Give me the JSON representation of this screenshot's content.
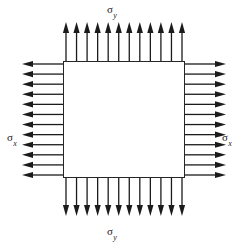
{
  "figure": {
    "type": "diagram",
    "width": 245,
    "height": 246,
    "background_color": "#ffffff",
    "stroke_color": "#1b1b1b"
  },
  "element": {
    "name": "square-element",
    "shape": "square",
    "x": 63,
    "y": 61,
    "width": 122,
    "height": 117,
    "fill": "#ffffff",
    "stroke": "#262626",
    "stroke_width": 1
  },
  "labels": {
    "sigma_y_top": {
      "symbol": "σ",
      "subscript": "y",
      "text": "σy"
    },
    "sigma_y_bottom": {
      "symbol": "σ",
      "subscript": "y",
      "text": "σy"
    },
    "sigma_x_left": {
      "symbol": "σ",
      "subscript": "x",
      "text": "σx"
    },
    "sigma_x_right": {
      "symbol": "σ",
      "subscript": "x",
      "text": "σx"
    }
  },
  "arrow_sets": [
    {
      "name": "top-arrows",
      "edge": "top",
      "direction": "up",
      "sense": "outward-tension",
      "count": 12,
      "tail_coord": 61,
      "tip_coord": 22,
      "span_start": 66,
      "span_end": 182
    },
    {
      "name": "bottom-arrows",
      "edge": "bottom",
      "direction": "down",
      "sense": "outward-tension",
      "count": 12,
      "tail_coord": 178,
      "tip_coord": 216,
      "span_start": 66,
      "span_end": 182
    },
    {
      "name": "left-arrows",
      "edge": "left",
      "direction": "left",
      "sense": "outward-tension",
      "count": 12,
      "tail_coord": 63,
      "tip_coord": 22,
      "span_start": 64,
      "span_end": 175
    },
    {
      "name": "right-arrows",
      "edge": "right",
      "direction": "right",
      "sense": "outward-tension",
      "count": 12,
      "tail_coord": 185,
      "tip_coord": 226,
      "span_start": 64,
      "span_end": 175
    }
  ],
  "arrow_style": {
    "shaft_width": 1.3,
    "head_length": 11,
    "head_half_width": 3.1,
    "color": "#1b1b1b"
  }
}
